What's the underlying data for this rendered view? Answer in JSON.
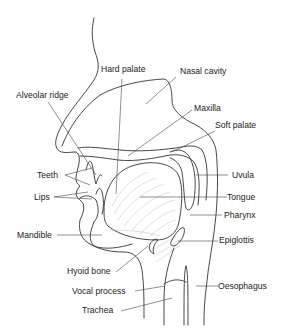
{
  "diagram": {
    "colors": {
      "background": "#ffffff",
      "outline": "#333333",
      "muscle_fibers": "#c4c4c4",
      "text": "#222222"
    },
    "labels": [
      {
        "id": "hard-palate",
        "text": "Hard palate"
      },
      {
        "id": "nasal-cavity",
        "text": "Nasal cavity"
      },
      {
        "id": "alveolar-ridge",
        "text": "Alveolar ridge"
      },
      {
        "id": "maxilla",
        "text": "Maxilla"
      },
      {
        "id": "soft-palate",
        "text": "Soft palate"
      },
      {
        "id": "teeth",
        "text": "Teeth"
      },
      {
        "id": "uvula",
        "text": "Uvula"
      },
      {
        "id": "lips",
        "text": "Lips"
      },
      {
        "id": "tongue",
        "text": "Tongue"
      },
      {
        "id": "pharynx",
        "text": "Pharynx"
      },
      {
        "id": "mandible",
        "text": "Mandible"
      },
      {
        "id": "epiglottis",
        "text": "Epiglottis"
      },
      {
        "id": "hyoid-bone",
        "text": "Hyoid bone"
      },
      {
        "id": "vocal-process",
        "text": "Vocal process"
      },
      {
        "id": "oesophagus",
        "text": "Oesophagus"
      },
      {
        "id": "trachea",
        "text": "Trachea"
      }
    ]
  }
}
